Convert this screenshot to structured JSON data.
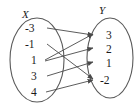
{
  "diagram": {
    "type": "mapping-diagram",
    "title": "",
    "domain_label": "X",
    "range_label": "Y",
    "domain_elements": [
      "-3",
      "-1",
      "1",
      "3",
      "4"
    ],
    "range_elements": [
      "3",
      "2",
      "1",
      "-2"
    ],
    "mappings": [
      {
        "from": "-3",
        "to": "3"
      },
      {
        "from": "-1",
        "to": "-2"
      },
      {
        "from": "1",
        "to": "3"
      },
      {
        "from": "1",
        "to": "2"
      },
      {
        "from": "3",
        "to": "1"
      },
      {
        "from": "4",
        "to": "-2"
      }
    ],
    "colors": {
      "stroke": "#5a5a5a",
      "line": "#4a4a4a",
      "text": "#1a1a1a",
      "background": "#ffffff"
    }
  }
}
